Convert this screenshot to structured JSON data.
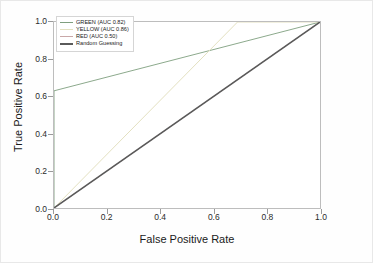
{
  "chart_data": {
    "type": "line",
    "title": "",
    "xlabel": "False Positive Rate",
    "ylabel": "True Positive Rate",
    "xlim": [
      0.0,
      1.0
    ],
    "ylim": [
      0.0,
      1.0
    ],
    "xticks": [
      "0.0",
      "0.2",
      "0.4",
      "0.6",
      "0.8",
      "1.0"
    ],
    "yticks": [
      "0.0",
      "0.2",
      "0.4",
      "0.6",
      "0.8",
      "1.0"
    ],
    "grid": false,
    "legend_position": "upper left",
    "series": [
      {
        "name": "GREEN (AUC 0.82)",
        "label": "GREEN (AUC 0.82)",
        "auc": 0.82,
        "color": "#7f9f7f",
        "x": [
          0.0,
          0.0,
          1.0
        ],
        "y": [
          0.0,
          0.63,
          1.0
        ]
      },
      {
        "name": "YELLOW (AUC 0.86)",
        "label": "YELLOW (AUC 0.86)",
        "auc": 0.86,
        "color": "#e3e0c0",
        "x": [
          0.0,
          0.69,
          1.0
        ],
        "y": [
          0.0,
          1.0,
          1.0
        ]
      },
      {
        "name": "RED (AUC 0.50)",
        "label": "RED (AUC 0.50)",
        "auc": 0.5,
        "color": "#c9a8a8",
        "x": [
          0.0,
          1.0
        ],
        "y": [
          0.0,
          1.0
        ]
      },
      {
        "name": "Random Guessing",
        "label": "Random Guessing",
        "auc": 0.5,
        "color": "#5a5a5a",
        "x": [
          0.0,
          1.0
        ],
        "y": [
          0.0,
          1.0
        ]
      }
    ]
  }
}
